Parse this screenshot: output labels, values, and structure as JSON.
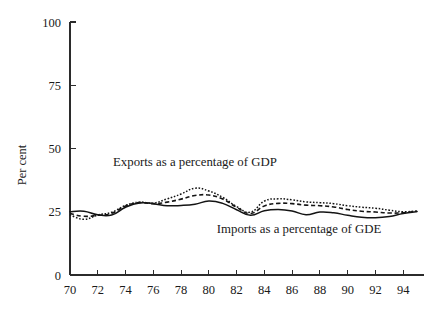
{
  "chart_data": {
    "type": "line",
    "title": "",
    "xlabel": "",
    "ylabel": "Per cent",
    "xlim": [
      70,
      95.5
    ],
    "ylim": [
      0,
      100
    ],
    "grid": false,
    "legend_position": "inline-annotations",
    "y_ticks": [
      0,
      25,
      50,
      75,
      100
    ],
    "y_tick_labels": [
      "0",
      "25",
      "50",
      "75",
      "100"
    ],
    "x_ticks": [
      70,
      72,
      74,
      76,
      78,
      80,
      82,
      84,
      86,
      88,
      90,
      92,
      94
    ],
    "x_tick_labels": [
      "70",
      "72",
      "74",
      "76",
      "78",
      "80",
      "82",
      "84",
      "86",
      "88",
      "90",
      "92",
      "94"
    ],
    "annotations": [
      {
        "text": "Exports as a percentage of GDP",
        "x": 79.0,
        "y": 43.0
      },
      {
        "text": "Imports as a percentage of GDE",
        "x": 86.5,
        "y": 16.5
      }
    ],
    "x": [
      70,
      71,
      72,
      73,
      74,
      75,
      76,
      77,
      78,
      79,
      80,
      81,
      82,
      83,
      84,
      85,
      86,
      87,
      88,
      89,
      90,
      91,
      92,
      93,
      94,
      95
    ],
    "series": [
      {
        "name": "Imports as a percentage of GDE",
        "style": "solid",
        "values": [
          25.0,
          25.2,
          23.8,
          23.7,
          26.8,
          28.5,
          28.2,
          27.4,
          27.5,
          28.0,
          29.2,
          28.3,
          25.8,
          23.6,
          25.4,
          25.9,
          25.3,
          23.8,
          24.9,
          24.6,
          23.6,
          22.8,
          22.6,
          23.1,
          24.3,
          25.1
        ]
      },
      {
        "name": "Exports as a percentage of GDP (measure 2)",
        "style": "dashed",
        "values": [
          24.3,
          23.2,
          23.6,
          24.4,
          27.3,
          28.6,
          28.2,
          28.8,
          30.0,
          31.4,
          31.6,
          30.0,
          26.8,
          24.3,
          27.3,
          28.3,
          28.2,
          27.6,
          27.4,
          26.9,
          25.9,
          25.2,
          24.9,
          24.5,
          24.6,
          25.2
        ]
      },
      {
        "name": "Exports as a percentage of GDP",
        "style": "dotted",
        "values": [
          23.8,
          22.0,
          23.7,
          24.8,
          27.5,
          28.8,
          28.4,
          30.1,
          32.0,
          34.3,
          33.2,
          30.7,
          27.1,
          24.8,
          29.2,
          30.1,
          29.7,
          28.9,
          28.6,
          28.2,
          27.4,
          26.8,
          26.4,
          25.6,
          25.0,
          25.3
        ]
      }
    ]
  },
  "figure": {
    "background": "#ffffff",
    "ink_color": "#141414"
  }
}
